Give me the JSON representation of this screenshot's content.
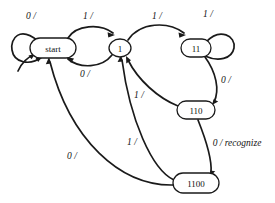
{
  "diagram": {
    "type": "finite-state-machine",
    "title": "",
    "colors": {
      "stroke": "#1a1a1a",
      "node_fill": "#ffffff",
      "background": "#ffffff",
      "text": "#111111"
    },
    "nodes": [
      {
        "id": "start",
        "label": "start",
        "cx": 53,
        "cy": 48,
        "rx": 23,
        "ry": 10
      },
      {
        "id": "s1",
        "label": "1",
        "cx": 120,
        "cy": 48,
        "rx": 11,
        "ry": 9
      },
      {
        "id": "s11",
        "label": "11",
        "cx": 196,
        "cy": 48,
        "rx": 15,
        "ry": 9
      },
      {
        "id": "s110",
        "label": "110",
        "cx": 196,
        "cy": 110,
        "rx": 19,
        "ry": 9
      },
      {
        "id": "s1100",
        "label": "1100",
        "cx": 196,
        "cy": 183,
        "rx": 23,
        "ry": 10
      }
    ],
    "edges": [
      {
        "id": "e-start-start",
        "from": "start",
        "to": "start",
        "label": "0 /",
        "label_x": 31,
        "label_y": 16,
        "kind": "self-loop"
      },
      {
        "id": "e-start-1",
        "from": "start",
        "to": "s1",
        "label": "1 /",
        "label_x": 88,
        "label_y": 16,
        "kind": "arc-above"
      },
      {
        "id": "e-1-start",
        "from": "s1",
        "to": "start",
        "label": "0 /",
        "label_x": 85,
        "label_y": 74,
        "kind": "arc-below"
      },
      {
        "id": "e-1-11",
        "from": "s1",
        "to": "s11",
        "label": "1 /",
        "label_x": 157,
        "label_y": 16,
        "kind": "arc-above"
      },
      {
        "id": "e-11-11",
        "from": "s11",
        "to": "s11",
        "label": "1 /",
        "label_x": 208,
        "label_y": 14,
        "kind": "self-loop"
      },
      {
        "id": "e-11-110",
        "from": "s11",
        "to": "s110",
        "label": "0 /",
        "label_x": 226,
        "label_y": 80,
        "kind": "curve-right"
      },
      {
        "id": "e-110-1",
        "from": "s110",
        "to": "s1",
        "label": "1 /",
        "label_x": 139,
        "label_y": 95,
        "kind": "curve-back"
      },
      {
        "id": "e-110-1100",
        "from": "s110",
        "to": "s1100",
        "label": "0 / recognize",
        "label_x": 237,
        "label_y": 143,
        "kind": "curve-down"
      },
      {
        "id": "e-1100-1",
        "from": "s1100",
        "to": "s1",
        "label": "1 /",
        "label_x": 132,
        "label_y": 142,
        "kind": "curve-back"
      },
      {
        "id": "e-1100-start",
        "from": "s1100",
        "to": "start",
        "label": "0 /",
        "label_x": 72,
        "label_y": 156,
        "kind": "curve-back-long"
      }
    ],
    "notes": {
      "recognized_pattern": "1100",
      "machine_kind": "Mealy machine"
    }
  }
}
